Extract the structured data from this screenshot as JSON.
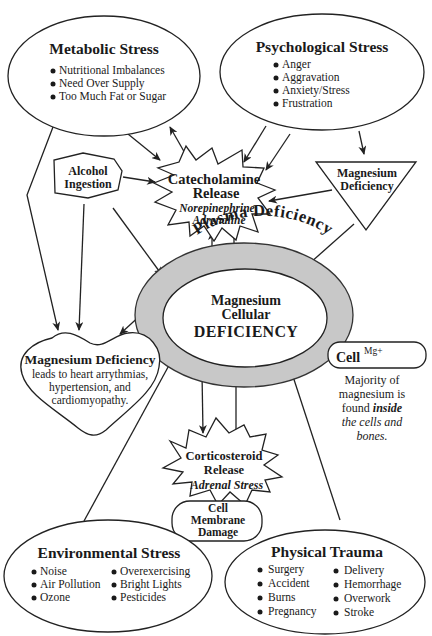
{
  "diagram": {
    "metabolic": {
      "title": "Metabolic Stress",
      "items": [
        "Nutritional Imbalances",
        "Need Over Supply",
        "Too Much Fat or Sugar"
      ]
    },
    "psychological": {
      "title": "Psychological Stress",
      "items": [
        "Anger",
        "Aggravation",
        "Anxiety/Stress",
        "Frustration"
      ]
    },
    "alcohol": {
      "line1": "Alcohol",
      "line2": "Ingestion"
    },
    "catecholamine": {
      "line1": "Catecholamine",
      "line2": "Release",
      "line3": "Norepinephrine",
      "line4": "Adrenaline"
    },
    "mg_deficiency_triangle": {
      "line1": "Magnesium",
      "line2": "Deficiency"
    },
    "center": {
      "ring_label": "Plasma Deficiency",
      "line1": "Magnesium",
      "line2": "Cellular",
      "line3": "DEFICIENCY",
      "ring_color": "#c8c8c8"
    },
    "heart": {
      "title": "Magnesium Deficiency",
      "line1": "leads to heart arrythmias,",
      "line2": "hypertension, and",
      "line3": "cardiomyopathy."
    },
    "cell": {
      "label": "Cell",
      "superscript": "Mg+",
      "note1": "Majority of",
      "note2": "magnesium is",
      "note3a": "found ",
      "note3b": "inside",
      "note4": "the cells and",
      "note5": "bones."
    },
    "corticosteroid": {
      "line1": "Corticosteroid",
      "line2": "Release",
      "line3": "Adrenal Stress"
    },
    "membrane": {
      "line1": "Cell",
      "line2": "Membrane",
      "line3": "Damage"
    },
    "environmental": {
      "title": "Environmental Stress",
      "col1": [
        "Noise",
        "Air Pollution",
        "Ozone"
      ],
      "col2": [
        "Overexercising",
        "Bright Lights",
        "Pesticides"
      ]
    },
    "physical": {
      "title": "Physical Trauma",
      "col1": [
        "Surgery",
        "Accident",
        "Burns",
        "Pregnancy"
      ],
      "col2": [
        "Delivery",
        "Hemorrhage",
        "Overwork",
        "Stroke"
      ]
    }
  }
}
